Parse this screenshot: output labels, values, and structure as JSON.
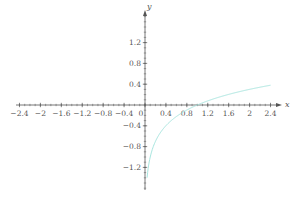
{
  "chart_data": {
    "type": "line",
    "title": "",
    "function": "y = log10(x)",
    "xlabel": "x",
    "ylabel": "y",
    "xlim": [
      -2.5,
      2.6
    ],
    "ylim": [
      -1.6,
      1.8
    ],
    "grid": false,
    "legend": null,
    "x_ticks": [
      "-2.4",
      "-2",
      "-1.6",
      "-1.2",
      "-0.8",
      "-0.4",
      "0",
      "0.4",
      "0.8",
      "1.2",
      "1.6",
      "2",
      "2.4"
    ],
    "y_ticks": [
      "1.2",
      "0.8",
      "0.4",
      "-0.4",
      "-0.8",
      "-1.2"
    ],
    "series": [
      {
        "name": "log10(x)",
        "color": "#a8e6df",
        "x": [
          0.04,
          0.06,
          0.1,
          0.15,
          0.2,
          0.3,
          0.4,
          0.6,
          0.8,
          1.0,
          1.2,
          1.6,
          2.0,
          2.4
        ],
        "y": [
          -1.4,
          -1.22,
          -1.0,
          -0.82,
          -0.7,
          -0.52,
          -0.4,
          -0.22,
          -0.1,
          0.0,
          0.08,
          0.2,
          0.3,
          0.38
        ]
      }
    ]
  },
  "axis_labels": {
    "x": "x",
    "y": "y"
  },
  "colors": {
    "axis": "#555555",
    "curve": "#a8e6df"
  }
}
